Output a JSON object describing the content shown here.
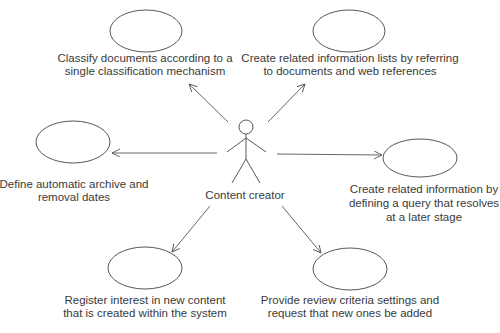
{
  "diagram": {
    "type": "uml-use-case",
    "actor": {
      "label": "Content creator",
      "x": 246,
      "y": 127
    },
    "use_cases": [
      {
        "id": "classify",
        "lines": [
          "Classify documents according to a",
          "single classification mechanism"
        ],
        "cx": 146,
        "cy": 31,
        "rx": 36,
        "ry": 21,
        "text_x": 145,
        "text_y": [
          62,
          75
        ],
        "arrow": {
          "x1": 228,
          "y1": 122,
          "x2": 189,
          "y2": 84
        }
      },
      {
        "id": "related-lists",
        "lines": [
          "Create related information lists by referring",
          "to documents and web references"
        ],
        "cx": 349,
        "cy": 31,
        "rx": 36,
        "ry": 21,
        "text_x": 350,
        "text_y": [
          62,
          75
        ],
        "arrow": {
          "x1": 268,
          "y1": 122,
          "x2": 305,
          "y2": 84
        }
      },
      {
        "id": "archive-dates",
        "lines": [
          "Define automatic archive and",
          "removal dates"
        ],
        "cx": 73,
        "cy": 142,
        "rx": 37,
        "ry": 21,
        "text_x": 74,
        "text_y": [
          188,
          201
        ],
        "arrow": {
          "x1": 217,
          "y1": 153,
          "x2": 112,
          "y2": 153
        }
      },
      {
        "id": "related-query",
        "lines": [
          "Create related information by",
          "defining a query that resolves",
          "at a later stage"
        ],
        "cx": 420,
        "cy": 158,
        "rx": 37,
        "ry": 19,
        "text_x": 424,
        "text_y": [
          193,
          207,
          221
        ],
        "arrow": {
          "x1": 277,
          "y1": 154,
          "x2": 382,
          "y2": 155
        }
      },
      {
        "id": "register-interest",
        "lines": [
          "Register interest in new content",
          "that is created within the system"
        ],
        "cx": 145,
        "cy": 268,
        "rx": 37,
        "ry": 21,
        "text_x": 145,
        "text_y": [
          304,
          317
        ],
        "arrow": {
          "x1": 210,
          "y1": 206,
          "x2": 172,
          "y2": 252
        }
      },
      {
        "id": "review-criteria",
        "lines": [
          "Provide review criteria settings and",
          "request that new ones be added"
        ],
        "cx": 350,
        "cy": 269,
        "rx": 37,
        "ry": 21,
        "text_x": 350,
        "text_y": [
          304,
          317
        ],
        "arrow": {
          "x1": 282,
          "y1": 206,
          "x2": 321,
          "y2": 253
        }
      }
    ]
  },
  "colors": {
    "stroke": "#444444",
    "text": "#3a3a3a",
    "background": "#ffffff"
  }
}
